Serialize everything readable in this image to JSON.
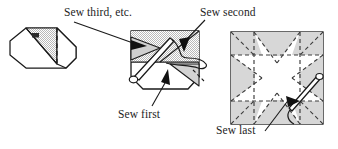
{
  "figure": {
    "type": "instructional-sewing-diagram",
    "panel_count": 3,
    "colors": {
      "outline": "#1a1a1a",
      "fill_shaded": "#d8d8d8",
      "fill_light": "#e6e6e6",
      "fill_white": "#ffffff",
      "dashed": "#4a4a4a",
      "arrow_solid": "#111111",
      "background": "#ffffff"
    }
  },
  "labels": {
    "third": "Sew third, etc.",
    "second": "Sew second",
    "first": "Sew first",
    "last": "Sew last"
  },
  "panels": [
    {
      "id": "panel-left",
      "name": "folded-unit-octagon",
      "description": "Octagonal folded fabric unit with shaded triangular flap and vertical dashed fold line"
    },
    {
      "id": "panel-middle",
      "name": "unit-with-needle",
      "description": "Partly assembled unit with needle, thread and arrows indicating first, second and third seams"
    },
    {
      "id": "panel-right",
      "name": "finished-star-block",
      "description": "Square block showing eight-point star of shaded triangles on dashed grid with needle for last seam"
    }
  ]
}
